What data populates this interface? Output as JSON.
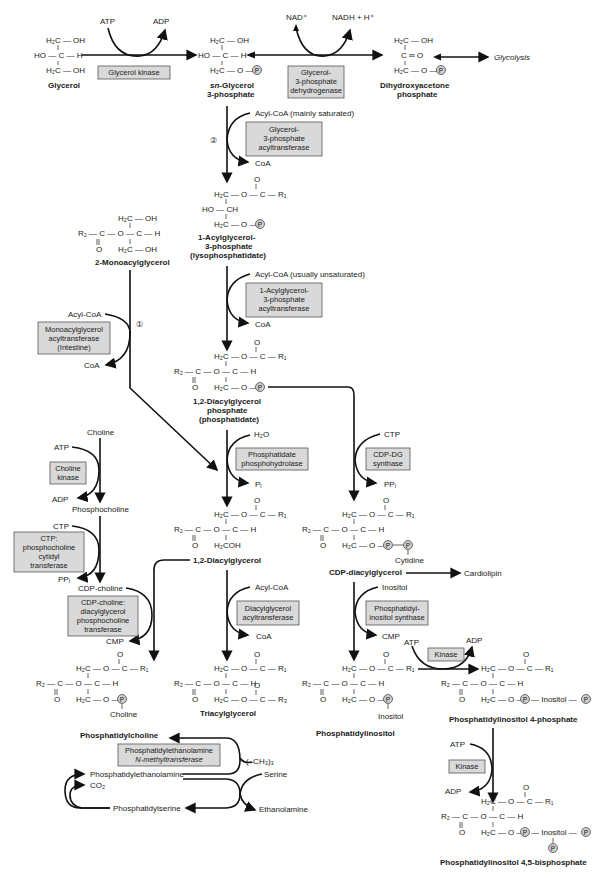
{
  "diagram": {
    "compounds": {
      "glycerol": "Glycerol",
      "g3p_1": "sn-Glycerol",
      "g3p_2": "3-phosphate",
      "dhap_1": "Dihydroxyacetone",
      "dhap_2": "phosphate",
      "glycolysis": "Glycolysis",
      "lpa_1": "1-Acylglycerol-",
      "lpa_2": "3-phosphate",
      "lpa_3": "(lysophosphatidate)",
      "mag": "2-Monoacylglycerol",
      "pa_1": "1,2-Diacylglycerol",
      "pa_2": "phosphate",
      "pa_3": "(phosphatidate)",
      "dag": "1,2-Diacylglycerol",
      "cdpdag": "CDP-diacylglycerol",
      "cardiolipin": "Cardiolipin",
      "tag": "Triacylglycerol",
      "pc": "Phosphatidylcholine",
      "pi": "Phosphatidylinositol",
      "pip": "Phosphatidylinositol 4-phosphate",
      "pip2": "Phosphatidylinositol 4,5-bisphosphate",
      "pe": "Phosphatidylethanolamine",
      "ps": "Phosphatidylserine",
      "choline": "Choline",
      "phosphocholine": "Phosphocholine",
      "cdpcholine": "CDP-choline"
    },
    "cofactors": {
      "atp": "ATP",
      "adp": "ADP",
      "nad": "NAD⁺",
      "nadh": "NADH + H⁺",
      "acylcoa_sat": "Acyl-CoA (mainly saturated)",
      "acylcoa_unsat": "Acyl-CoA (usually unsaturated)",
      "acylcoa": "Acyl-CoA",
      "coa": "CoA",
      "h2o": "H₂O",
      "pi": "Pᵢ",
      "ctp": "CTP",
      "ppi": "PPᵢ",
      "cmp": "CMP",
      "inositol": "Inositol",
      "serine": "Serine",
      "ethanolamine": "Ethanolamine",
      "co2": "CO₂",
      "methyl": "(–CH₃)₃",
      "cytidine": "Cytidine",
      "choline_sub": "Choline",
      "inositol_sub": "Inositol"
    },
    "enzymes": {
      "glycerol_kinase": [
        "Glycerol kinase"
      ],
      "g3p_dh": [
        "Glycerol-",
        "3-phosphate",
        "dehydrogenase"
      ],
      "g3p_at": [
        "Glycerol-",
        "3-phosphate",
        "acyltransferase"
      ],
      "agp_at": [
        "1-Acylglycerol-",
        "3-phosphate",
        "acyltransferase"
      ],
      "mag_at": [
        "Monoacylglycerol",
        "acyltransferase",
        "(Intestine)"
      ],
      "pap": [
        "Phosphatidate",
        "phosphohydrolase"
      ],
      "cdpdg_syn": [
        "CDP-DG",
        "synthase"
      ],
      "choline_kinase": [
        "Choline",
        "kinase"
      ],
      "ct": [
        "CTP:",
        "phosphocholine",
        "cytidyl",
        "transferase"
      ],
      "cpt": [
        "CDP-choline:",
        "diacylglycerol",
        "phosphocholine",
        "transferase"
      ],
      "dgat": [
        "Diacylglycerol",
        "acyltransferase"
      ],
      "pis": [
        "Phosphatidyl-",
        "inositol synthase"
      ],
      "kinase1": [
        "Kinase"
      ],
      "kinase2": [
        "Kinase"
      ],
      "pemt": [
        "Phosphatidylethanolamine",
        "N-methyltransferase"
      ]
    },
    "markers": {
      "route1": "①",
      "route2": "②"
    },
    "atoms": {
      "h2c_oh": "H₂C — OH",
      "ho_c_h": "HO — C — H",
      "h2c_op": "H₂C — O —",
      "c_eq_o": "C ═ O",
      "h2c_oc_r1": "H₂C — O — C — R₁",
      "ho_ch": "HO — CH",
      "r2_c_o_c_h": "R₂ — C — O — C — H",
      "o": "O",
      "h2coh": "H₂COH",
      "h2c_oc_r3": "H₂C — O — C — R₃",
      "p": "P",
      "inositol_dash": "— Inositol —"
    },
    "colors": {
      "enzyme_box": "#d9d9d9",
      "phosphate_circle": "#cfcfcf",
      "line": "#111111"
    }
  }
}
